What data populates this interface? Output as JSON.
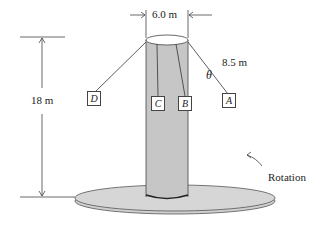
{
  "diagram": {
    "dimensions": {
      "diameter_label": "6.0 m",
      "height_label": "18 m",
      "cable_length_label": "8.5 m",
      "angle_label": "θ"
    },
    "seats": [
      {
        "id": "A",
        "label": "A"
      },
      {
        "id": "B",
        "label": "B"
      },
      {
        "id": "C",
        "label": "C"
      },
      {
        "id": "D",
        "label": "D"
      }
    ],
    "rotation_label": "Rotation",
    "colors": {
      "pole_fill": "#c8c8c8",
      "platform_fill": "#d4d4d4",
      "line": "#333333"
    }
  }
}
